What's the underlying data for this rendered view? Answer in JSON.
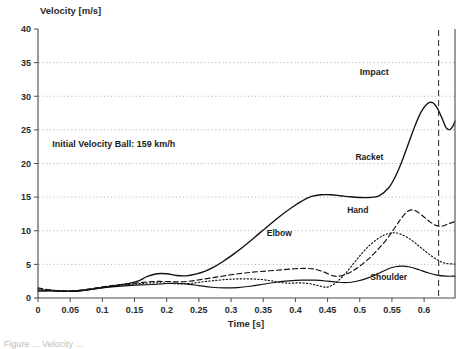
{
  "figure": {
    "caption_fragment": "Figure ... Velocity ..."
  },
  "chart_data": {
    "type": "line",
    "title": "",
    "xlabel": "Time [s]",
    "ylabel": "Velocity [m/s]",
    "xlim": [
      0,
      0.648
    ],
    "ylim": [
      0,
      40
    ],
    "xticks": [
      0,
      0.05,
      0.1,
      0.15,
      0.2,
      0.25,
      0.3,
      0.35,
      0.4,
      0.45,
      0.5,
      0.55,
      0.6
    ],
    "xtick_labels": [
      "0",
      "0.05",
      "0.1",
      "0.15",
      "0.2",
      "0.25",
      "0.3",
      "0.35",
      "0.4",
      "0.45",
      "0.5",
      "0.55",
      "0.6"
    ],
    "yticks": [
      0,
      5,
      10,
      15,
      20,
      25,
      30,
      35,
      40
    ],
    "ytick_labels": [
      "0",
      "5",
      "10",
      "15",
      "20",
      "25",
      "30",
      "35",
      "40"
    ],
    "grid": "horizontal-dotted",
    "legend": "inline-labels",
    "annotations": [
      {
        "name": "initial-velocity-note",
        "text": "Initial Velocity Ball:  159 km/h",
        "x": 0.022,
        "y": 22.5
      },
      {
        "name": "impact-note",
        "text": "Impact",
        "x": 0.5,
        "y": 33.2
      }
    ],
    "vlines": [
      {
        "name": "impact-line",
        "x": 0.6225,
        "style": "dashed",
        "label": "Impact"
      }
    ],
    "series": [
      {
        "name": "Racket",
        "style": "solid-thick",
        "label_x": 0.515,
        "label_y": 20.5,
        "points": [
          [
            0.0,
            1.0
          ],
          [
            0.02,
            1.05
          ],
          [
            0.04,
            1.0
          ],
          [
            0.06,
            1.0
          ],
          [
            0.08,
            1.25
          ],
          [
            0.1,
            1.55
          ],
          [
            0.12,
            1.85
          ],
          [
            0.14,
            2.15
          ],
          [
            0.155,
            2.5
          ],
          [
            0.17,
            3.2
          ],
          [
            0.185,
            3.6
          ],
          [
            0.2,
            3.6
          ],
          [
            0.215,
            3.35
          ],
          [
            0.23,
            3.3
          ],
          [
            0.245,
            3.55
          ],
          [
            0.26,
            4.0
          ],
          [
            0.275,
            4.7
          ],
          [
            0.29,
            5.6
          ],
          [
            0.305,
            6.6
          ],
          [
            0.32,
            7.7
          ],
          [
            0.335,
            8.9
          ],
          [
            0.35,
            10.1
          ],
          [
            0.365,
            11.3
          ],
          [
            0.38,
            12.45
          ],
          [
            0.395,
            13.5
          ],
          [
            0.41,
            14.4
          ],
          [
            0.425,
            15.1
          ],
          [
            0.44,
            15.35
          ],
          [
            0.455,
            15.35
          ],
          [
            0.47,
            15.2
          ],
          [
            0.485,
            15.05
          ],
          [
            0.5,
            14.95
          ],
          [
            0.515,
            14.95
          ],
          [
            0.53,
            15.2
          ],
          [
            0.545,
            16.4
          ],
          [
            0.555,
            18.0
          ],
          [
            0.565,
            20.2
          ],
          [
            0.575,
            22.8
          ],
          [
            0.585,
            25.4
          ],
          [
            0.595,
            27.6
          ],
          [
            0.605,
            28.9
          ],
          [
            0.613,
            29.05
          ],
          [
            0.62,
            28.3
          ],
          [
            0.628,
            26.7
          ],
          [
            0.634,
            25.35
          ],
          [
            0.64,
            25.05
          ],
          [
            0.645,
            25.6
          ],
          [
            0.648,
            26.3
          ]
        ]
      },
      {
        "name": "Hand",
        "style": "dashed",
        "label_x": 0.497,
        "label_y": 12.6,
        "points": [
          [
            0.0,
            1.5
          ],
          [
            0.02,
            1.2
          ],
          [
            0.04,
            1.05
          ],
          [
            0.06,
            1.1
          ],
          [
            0.08,
            1.35
          ],
          [
            0.1,
            1.65
          ],
          [
            0.12,
            1.9
          ],
          [
            0.14,
            2.1
          ],
          [
            0.16,
            2.3
          ],
          [
            0.18,
            2.45
          ],
          [
            0.2,
            2.45
          ],
          [
            0.22,
            2.4
          ],
          [
            0.24,
            2.55
          ],
          [
            0.26,
            2.85
          ],
          [
            0.28,
            3.15
          ],
          [
            0.3,
            3.45
          ],
          [
            0.32,
            3.7
          ],
          [
            0.34,
            3.9
          ],
          [
            0.36,
            4.05
          ],
          [
            0.38,
            4.2
          ],
          [
            0.4,
            4.35
          ],
          [
            0.415,
            4.4
          ],
          [
            0.43,
            4.3
          ],
          [
            0.445,
            3.85
          ],
          [
            0.458,
            3.3
          ],
          [
            0.468,
            3.25
          ],
          [
            0.48,
            3.6
          ],
          [
            0.495,
            4.4
          ],
          [
            0.51,
            5.5
          ],
          [
            0.525,
            6.9
          ],
          [
            0.54,
            8.5
          ],
          [
            0.552,
            10.1
          ],
          [
            0.562,
            11.5
          ],
          [
            0.572,
            12.7
          ],
          [
            0.58,
            13.1
          ],
          [
            0.588,
            12.9
          ],
          [
            0.598,
            12.2
          ],
          [
            0.608,
            11.4
          ],
          [
            0.618,
            10.8
          ],
          [
            0.628,
            10.7
          ],
          [
            0.638,
            11.05
          ],
          [
            0.648,
            11.35
          ]
        ]
      },
      {
        "name": "Elbow",
        "style": "dotted",
        "label_x": 0.375,
        "label_y": 9.2,
        "points": [
          [
            0.0,
            1.35
          ],
          [
            0.02,
            1.15
          ],
          [
            0.04,
            1.05
          ],
          [
            0.06,
            1.1
          ],
          [
            0.08,
            1.3
          ],
          [
            0.1,
            1.55
          ],
          [
            0.12,
            1.8
          ],
          [
            0.14,
            2.0
          ],
          [
            0.16,
            2.15
          ],
          [
            0.18,
            2.25
          ],
          [
            0.2,
            2.2
          ],
          [
            0.22,
            2.1
          ],
          [
            0.24,
            2.2
          ],
          [
            0.26,
            2.45
          ],
          [
            0.28,
            2.65
          ],
          [
            0.3,
            2.8
          ],
          [
            0.32,
            2.85
          ],
          [
            0.34,
            2.8
          ],
          [
            0.36,
            2.6
          ],
          [
            0.375,
            2.35
          ],
          [
            0.39,
            2.2
          ],
          [
            0.405,
            2.25
          ],
          [
            0.42,
            2.15
          ],
          [
            0.435,
            1.85
          ],
          [
            0.448,
            1.6
          ],
          [
            0.458,
            1.95
          ],
          [
            0.468,
            2.7
          ],
          [
            0.48,
            3.9
          ],
          [
            0.492,
            5.3
          ],
          [
            0.504,
            6.7
          ],
          [
            0.516,
            7.9
          ],
          [
            0.528,
            8.8
          ],
          [
            0.54,
            9.45
          ],
          [
            0.552,
            9.7
          ],
          [
            0.562,
            9.55
          ],
          [
            0.574,
            9.0
          ],
          [
            0.586,
            8.2
          ],
          [
            0.598,
            7.25
          ],
          [
            0.61,
            6.35
          ],
          [
            0.622,
            5.6
          ],
          [
            0.634,
            5.15
          ],
          [
            0.648,
            5.05
          ]
        ]
      },
      {
        "name": "Shoulder",
        "style": "solid-thin",
        "label_x": 0.545,
        "label_y": 2.75,
        "points": [
          [
            0.0,
            1.2
          ],
          [
            0.02,
            1.1
          ],
          [
            0.04,
            1.0
          ],
          [
            0.06,
            1.05
          ],
          [
            0.08,
            1.25
          ],
          [
            0.1,
            1.5
          ],
          [
            0.12,
            1.7
          ],
          [
            0.14,
            1.85
          ],
          [
            0.16,
            1.95
          ],
          [
            0.18,
            2.0
          ],
          [
            0.2,
            2.15
          ],
          [
            0.215,
            2.2
          ],
          [
            0.23,
            2.1
          ],
          [
            0.25,
            1.85
          ],
          [
            0.27,
            1.6
          ],
          [
            0.29,
            1.5
          ],
          [
            0.31,
            1.55
          ],
          [
            0.33,
            1.75
          ],
          [
            0.35,
            2.05
          ],
          [
            0.37,
            2.35
          ],
          [
            0.39,
            2.55
          ],
          [
            0.41,
            2.65
          ],
          [
            0.43,
            2.65
          ],
          [
            0.45,
            2.5
          ],
          [
            0.465,
            2.35
          ],
          [
            0.48,
            2.3
          ],
          [
            0.495,
            2.5
          ],
          [
            0.512,
            2.95
          ],
          [
            0.528,
            3.6
          ],
          [
            0.542,
            4.25
          ],
          [
            0.555,
            4.65
          ],
          [
            0.566,
            4.75
          ],
          [
            0.578,
            4.6
          ],
          [
            0.592,
            4.2
          ],
          [
            0.606,
            3.75
          ],
          [
            0.62,
            3.4
          ],
          [
            0.634,
            3.25
          ],
          [
            0.648,
            3.25
          ]
        ]
      }
    ]
  }
}
